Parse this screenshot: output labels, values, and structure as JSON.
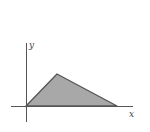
{
  "diagram": {
    "type": "region-under-piecewise-linear-graph",
    "x_axis_label": "x",
    "y_axis_label": "y",
    "vertices": [
      [
        0,
        0
      ],
      [
        1,
        1
      ],
      [
        3,
        0
      ]
    ],
    "colors": {
      "fill": "#a8a8a8",
      "stroke": "#555555",
      "axis": "#555555",
      "background": "#ffffff"
    }
  }
}
